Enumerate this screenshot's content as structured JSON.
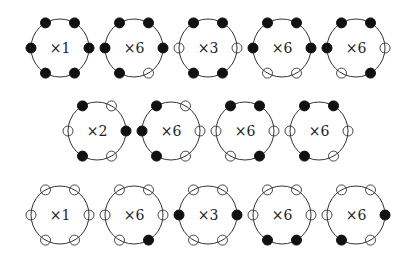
{
  "diagram": {
    "colors": {
      "ring": "#333333",
      "filled": "#111111",
      "open_fill": "#ffffff",
      "open_stroke": "#333333",
      "text": "#222222"
    },
    "positions": [
      "tl",
      "tr",
      "l",
      "r",
      "bl",
      "br"
    ],
    "rows": [
      {
        "y": 48,
        "items": [
          {
            "x": 60,
            "label": "×1",
            "nodes": {
              "tl": "filled",
              "tr": "filled",
              "l": "filled",
              "r": "filled",
              "bl": "filled",
              "br": "filled"
            }
          },
          {
            "x": 134,
            "label": "×6",
            "nodes": {
              "tl": "filled",
              "tr": "filled",
              "l": "filled",
              "r": "filled",
              "bl": "filled",
              "br": "open"
            }
          },
          {
            "x": 208,
            "label": "×3",
            "nodes": {
              "tl": "filled",
              "tr": "filled",
              "l": "open",
              "r": "open",
              "bl": "filled",
              "br": "filled"
            }
          },
          {
            "x": 282,
            "label": "×6",
            "nodes": {
              "tl": "filled",
              "tr": "filled",
              "l": "filled",
              "r": "filled",
              "bl": "open",
              "br": "open"
            }
          },
          {
            "x": 356,
            "label": "×6",
            "nodes": {
              "tl": "filled",
              "tr": "filled",
              "l": "filled",
              "r": "open",
              "bl": "open",
              "br": "filled"
            }
          }
        ]
      },
      {
        "y": 131,
        "items": [
          {
            "x": 97,
            "label": "×2",
            "nodes": {
              "tl": "filled",
              "tr": "open",
              "l": "open",
              "r": "filled",
              "bl": "filled",
              "br": "open"
            }
          },
          {
            "x": 171,
            "label": "×6",
            "nodes": {
              "tl": "filled",
              "tr": "open",
              "l": "filled",
              "r": "open",
              "bl": "filled",
              "br": "open"
            }
          },
          {
            "x": 245,
            "label": "×6",
            "nodes": {
              "tl": "filled",
              "tr": "filled",
              "l": "open",
              "r": "open",
              "bl": "open",
              "br": "filled"
            }
          },
          {
            "x": 319,
            "label": "×6",
            "nodes": {
              "tl": "filled",
              "tr": "filled",
              "l": "open",
              "r": "open",
              "bl": "filled",
              "br": "open"
            }
          }
        ]
      },
      {
        "y": 215,
        "items": [
          {
            "x": 60,
            "label": "×1",
            "nodes": {
              "tl": "open",
              "tr": "open",
              "l": "open",
              "r": "open",
              "bl": "open",
              "br": "open"
            }
          },
          {
            "x": 134,
            "label": "×6",
            "nodes": {
              "tl": "open",
              "tr": "open",
              "l": "open",
              "r": "open",
              "bl": "open",
              "br": "filled"
            }
          },
          {
            "x": 208,
            "label": "×3",
            "nodes": {
              "tl": "open",
              "tr": "open",
              "l": "filled",
              "r": "filled",
              "bl": "open",
              "br": "open"
            }
          },
          {
            "x": 282,
            "label": "×6",
            "nodes": {
              "tl": "open",
              "tr": "open",
              "l": "open",
              "r": "open",
              "bl": "filled",
              "br": "filled"
            }
          },
          {
            "x": 356,
            "label": "×6",
            "nodes": {
              "tl": "open",
              "tr": "open",
              "l": "open",
              "r": "filled",
              "bl": "filled",
              "br": "open"
            }
          }
        ]
      }
    ]
  }
}
